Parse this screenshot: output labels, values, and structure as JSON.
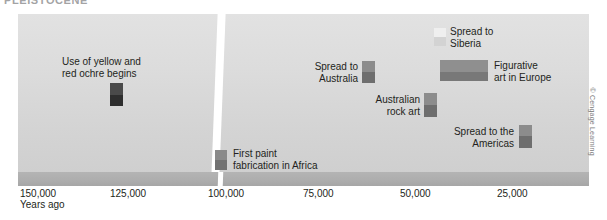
{
  "figure": {
    "epoch_title": "PLEISTOCENE",
    "credit": "© Cengage Learning"
  },
  "axis": {
    "unit_label": "Years ago",
    "ticks": [
      {
        "label": "150,000",
        "x": 20
      },
      {
        "label": "125,000",
        "x": 110
      },
      {
        "label": "100,000",
        "x": 208
      },
      {
        "label": "75,000",
        "x": 303
      },
      {
        "label": "50,000",
        "x": 400
      },
      {
        "label": "25,000",
        "x": 497
      }
    ]
  },
  "events": [
    {
      "id": "ochre",
      "caption": "Use of yellow and\nred ochre begins",
      "caption_side": "above",
      "tone": "tone-dark",
      "bar": {
        "left": 110,
        "top": 83,
        "width": 13,
        "height": 23
      },
      "caption_box": {
        "left": 62,
        "top": 56,
        "width": 120
      }
    },
    {
      "id": "first-paint",
      "caption": "First paint\nfabrication in Africa",
      "caption_side": "right",
      "tone": "tone-mid2",
      "bar": {
        "left": 215,
        "top": 150,
        "width": 12,
        "height": 20
      },
      "caption_box": {
        "left": 233,
        "top": 148,
        "width": 130
      }
    },
    {
      "id": "australia",
      "caption": "Spread to\nAustralia",
      "caption_side": "left",
      "tone": "tone-mid",
      "bar": {
        "left": 362,
        "top": 61,
        "width": 13,
        "height": 22
      },
      "caption_box": {
        "left": 290,
        "top": 61,
        "width": 68
      }
    },
    {
      "id": "rock-art",
      "caption": "Australian\nrock art",
      "caption_side": "left",
      "tone": "tone-mid",
      "bar": {
        "left": 424,
        "top": 93,
        "width": 13,
        "height": 24
      },
      "caption_box": {
        "left": 352,
        "top": 94,
        "width": 68
      }
    },
    {
      "id": "siberia",
      "caption": "Spread to\nSiberia",
      "caption_side": "right",
      "tone": "tone-light",
      "bar": {
        "left": 434,
        "top": 28,
        "width": 12,
        "height": 18
      },
      "caption_box": {
        "left": 450,
        "top": 26,
        "width": 80
      }
    },
    {
      "id": "figurative-europe",
      "caption": "Figurative\nart in Europe",
      "caption_side": "right",
      "tone": "tone-wide",
      "bar": {
        "left": 440,
        "top": 60,
        "width": 48,
        "height": 21
      },
      "caption_box": {
        "left": 494,
        "top": 60,
        "width": 90
      }
    },
    {
      "id": "americas",
      "caption": "Spread to the\nAmericas",
      "caption_side": "left",
      "tone": "tone-mid",
      "bar": {
        "left": 519,
        "top": 125,
        "width": 13,
        "height": 23
      },
      "caption_box": {
        "left": 428,
        "top": 126,
        "width": 86
      }
    }
  ],
  "chart_data": {
    "type": "bar",
    "title": "PLEISTOCENE",
    "xlabel": "Years ago",
    "ylabel": "",
    "xlim": [
      150000,
      15000
    ],
    "grid": false,
    "legend": "none",
    "orientation": "timeline",
    "note": "Horizontal archaeological timeline; each marker is an event placed at an approximate date (years ago). Bar width indicates the duration/uncertainty span of the event.",
    "tick_labels": [
      "150,000",
      "125,000",
      "100,000",
      "75,000",
      "50,000",
      "25,000"
    ],
    "categories": [
      "Use of yellow and red ochre begins",
      "First paint fabrication in Africa",
      "Spread to Australia",
      "Australian rock art",
      "Spread to Siberia",
      "Figurative art in Europe",
      "Spread to the Americas"
    ],
    "values": [
      125000,
      98000,
      60000,
      45000,
      42000,
      40000,
      16000
    ],
    "annotations": [
      {
        "label": "Use of yellow and red ochre begins",
        "years_ago": 125000
      },
      {
        "label": "First paint fabrication in Africa",
        "years_ago": 98000
      },
      {
        "label": "Spread to Australia",
        "years_ago": 60000
      },
      {
        "label": "Australian rock art",
        "years_ago": 45000
      },
      {
        "label": "Spread to Siberia",
        "years_ago": 42000
      },
      {
        "label": "Figurative art in Europe",
        "years_ago": 40000
      },
      {
        "label": "Spread to the Americas",
        "years_ago": 16000
      }
    ]
  },
  "colors": {
    "band": "#dcdcdc",
    "axis_strip": "#adadad",
    "text": "#231f20",
    "bar_dark": "#3a3a3a",
    "bar_mid": "#7e7e7e",
    "bar_light": "#e4e4e4"
  }
}
